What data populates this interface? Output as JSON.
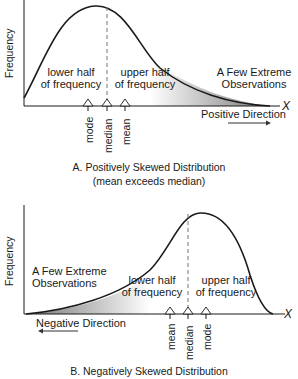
{
  "panel_a": {
    "y_label": "Frequency",
    "x_label": "X",
    "lower_half": [
      "lower half",
      "of frequency"
    ],
    "upper_half": [
      "upper half",
      "of frequency"
    ],
    "extreme": [
      "A Few Extreme",
      "Observations"
    ],
    "direction": "Positive Direction",
    "markers": [
      "mode",
      "median",
      "mean"
    ],
    "caption": "A. Positively Skewed Distribution",
    "subcaption": "(mean exceeds median)"
  },
  "panel_b": {
    "y_label": "Frequency",
    "x_label": "X",
    "lower_half": [
      "lower half",
      "of frequency"
    ],
    "upper_half": [
      "upper half",
      "of frequency"
    ],
    "extreme": [
      "A Few Extreme",
      "Observations"
    ],
    "direction": "Negative Direction",
    "markers": [
      "mean",
      "median",
      "mode"
    ],
    "caption": "B. Negatively Skewed Distribution"
  },
  "colors": {
    "line": "#1a1a1a",
    "dash": "#777777",
    "shade": "#9a9a9a"
  }
}
